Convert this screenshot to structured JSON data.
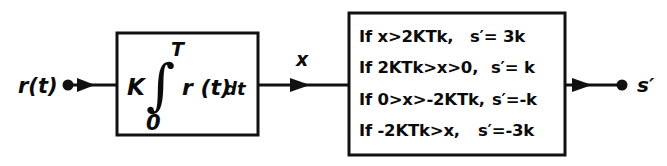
{
  "diagram": {
    "background_color": "#ffffff",
    "ink_color": "#111111"
  },
  "input": {
    "label": "r(t)",
    "node_name": "input-node"
  },
  "integrator_block": {
    "gain": "K",
    "integral_symbol": "∫",
    "upper_limit": "T",
    "lower_limit": "0",
    "integrand": "r (t)",
    "differential": "dt",
    "expression": "K ∫0T r (t) dt"
  },
  "intermediate_signal": {
    "label": "x"
  },
  "quantizer_block": {
    "conditions": [
      {
        "condition": "If x>2KTk,",
        "result": "s′= 3k"
      },
      {
        "condition": "If 2KTk>x>0,",
        "result": "s′= k"
      },
      {
        "condition": "If 0>x>-2KTk,",
        "result": "s′=-k"
      },
      {
        "condition": "If -2KTk>x,",
        "result": "s′=-3k"
      }
    ]
  },
  "output": {
    "label": "s′",
    "node_name": "output-node"
  }
}
